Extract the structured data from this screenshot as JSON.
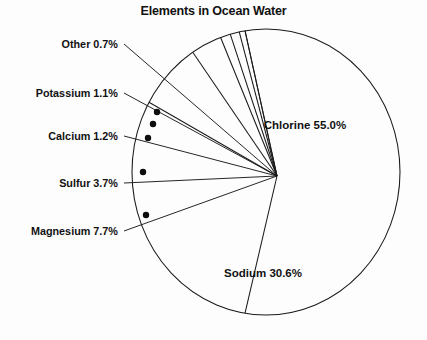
{
  "chart_data": {
    "type": "pie",
    "title": "Elements in Ocean Water",
    "xlabel": "",
    "ylabel": "",
    "unit": "%",
    "legend": "none",
    "grid": false,
    "categories": [
      "Chlorine",
      "Sodium",
      "Magnesium",
      "Sulfur",
      "Calcium",
      "Potassium",
      "Other"
    ],
    "values": [
      55.0,
      30.6,
      7.7,
      3.7,
      1.2,
      1.1,
      0.7
    ],
    "slices": [
      {
        "name": "Chlorine",
        "value": 55.0,
        "label": "Chlorine 55.0%",
        "label_placement": "inside",
        "label_x": 305,
        "label_y": 129
      },
      {
        "name": "Sodium",
        "value": 30.6,
        "label": "Sodium 30.6%",
        "label_placement": "inside",
        "label_x": 263,
        "label_y": 277
      },
      {
        "name": "Magnesium",
        "value": 7.7,
        "label": "Magnesium 7.7%",
        "label_placement": "callout",
        "label_x": 118,
        "label_y": 235,
        "label_anchor": "end",
        "dot_x": 146,
        "dot_y": 215,
        "leader_x": 124,
        "leader_y": 231
      },
      {
        "name": "Sulfur",
        "value": 3.7,
        "label": "Sulfur 3.7%",
        "label_placement": "callout",
        "label_x": 118,
        "label_y": 187,
        "label_anchor": "end",
        "dot_x": 143,
        "dot_y": 172,
        "leader_x": 124,
        "leader_y": 183
      },
      {
        "name": "Calcium",
        "value": 1.2,
        "label": "Calcium 1.2%",
        "label_placement": "callout",
        "label_x": 118,
        "label_y": 140,
        "label_anchor": "end",
        "dot_x": 148,
        "dot_y": 138,
        "leader_x": 124,
        "leader_y": 136
      },
      {
        "name": "Potassium",
        "value": 1.1,
        "label": "Potassium 1.1%",
        "label_placement": "callout",
        "label_x": 118,
        "label_y": 97,
        "label_anchor": "end",
        "dot_x": 153,
        "dot_y": 124,
        "leader_x": 124,
        "leader_y": 93
      },
      {
        "name": "Other",
        "value": 0.7,
        "label": "Other 0.7%",
        "label_placement": "callout",
        "label_x": 118,
        "label_y": 48,
        "label_anchor": "end",
        "dot_x": 157,
        "dot_y": 112,
        "leader_x": 124,
        "leader_y": 44
      }
    ],
    "geometry": {
      "center_x": 266,
      "center_y": 172,
      "radius_x": 134,
      "radius_y": 143,
      "apex_x": 277,
      "apex_y": 176,
      "start_angle_deg": -99
    },
    "colors": {
      "stroke": "#1a1a1a",
      "fill": "#ffffff",
      "text": "#121212",
      "background": "#fdfdfd"
    }
  }
}
